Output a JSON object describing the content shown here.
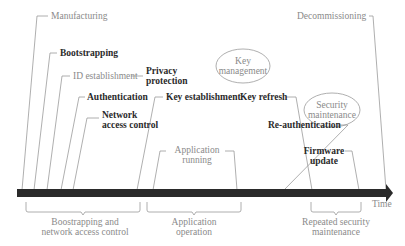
{
  "diagram": {
    "type": "timeline",
    "axis": {
      "label": "Time",
      "color": "#222222"
    },
    "events": [
      {
        "id": "manufacturing",
        "label": "Manufacturing",
        "style": "gray"
      },
      {
        "id": "bootstrapping",
        "label": "Bootstrapping",
        "style": "bold"
      },
      {
        "id": "id-establishment",
        "label": "ID establishment",
        "style": "gray"
      },
      {
        "id": "privacy-protection",
        "label_line1": "Privacy",
        "label_line2": "protection",
        "style": "bold"
      },
      {
        "id": "authentication",
        "label": "Authentication",
        "style": "bold"
      },
      {
        "id": "network-access-control",
        "label_line1": "Network",
        "label_line2": "access control",
        "style": "bold"
      },
      {
        "id": "key-establishment",
        "label": "Key establishment",
        "style": "bold"
      },
      {
        "id": "key-refresh",
        "label": "Key refresh",
        "style": "bold"
      },
      {
        "id": "re-authentication",
        "label": "Re-authentication",
        "style": "bold"
      },
      {
        "id": "application-running",
        "label_line1": "Application",
        "label_line2": "running",
        "style": "gray"
      },
      {
        "id": "firmware-update",
        "label_line1": "Firmware",
        "label_line2": "update",
        "style": "bold"
      },
      {
        "id": "decommissioning",
        "label": "Decommissioning",
        "style": "gray"
      }
    ],
    "ellipses": [
      {
        "id": "key-management",
        "label_line1": "Key",
        "label_line2": "management"
      },
      {
        "id": "security-maintenance",
        "label_line1": "Security",
        "label_line2": "maintenance"
      }
    ],
    "phases": [
      {
        "id": "bootstrapping-phase",
        "label_line1": "Boostrapping and",
        "label_line2": "network access control"
      },
      {
        "id": "application-phase",
        "label_line1": "Application",
        "label_line2": "operation"
      },
      {
        "id": "maintenance-phase",
        "label_line1": "Repeated security",
        "label_line2": "maintenance"
      }
    ]
  }
}
